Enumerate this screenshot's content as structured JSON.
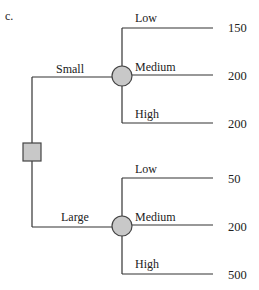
{
  "figure_label": "c.",
  "colors": {
    "line": "#333333",
    "node_fill": "#c8c8c8",
    "node_stroke": "#444444",
    "text": "#222222"
  },
  "decision_node": {
    "shape": "square",
    "branches": [
      {
        "label": "Small",
        "chance_node": {
          "shape": "circle",
          "outcomes": [
            {
              "label": "Low",
              "payoff": "150"
            },
            {
              "label": "Medium",
              "payoff": "200"
            },
            {
              "label": "High",
              "payoff": "200"
            }
          ]
        }
      },
      {
        "label": "Large",
        "chance_node": {
          "shape": "circle",
          "outcomes": [
            {
              "label": "Low",
              "payoff": "50"
            },
            {
              "label": "Medium",
              "payoff": "200"
            },
            {
              "label": "High",
              "payoff": "500"
            }
          ]
        }
      }
    ]
  }
}
